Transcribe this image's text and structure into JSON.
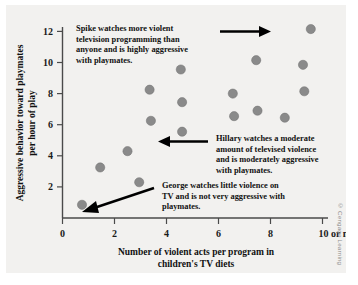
{
  "chart_data": {
    "type": "scatter",
    "title": "",
    "xlabel": "Number of violent acts per program in children's TV diets",
    "xlabel_line1": "Number of violent acts per program in",
    "xlabel_line2": "children's TV diets",
    "ylabel": "Aggressive behavior toward playmates per hour of play",
    "ylabel_line1": "Aggressive behavior toward playmates",
    "ylabel_line2": "per hour of play",
    "xlim": [
      0,
      10.6
    ],
    "ylim": [
      0,
      12.6
    ],
    "xticks": [
      0,
      2,
      4,
      6,
      8,
      10
    ],
    "xtick_labels": [
      "0",
      "2",
      "4",
      "6",
      "8",
      "10 or more"
    ],
    "yticks": [
      2,
      4,
      6,
      8,
      10,
      12
    ],
    "ytick_labels": [
      "2",
      "4",
      "6",
      "8",
      "10",
      "12"
    ],
    "grid": false,
    "legend": "none",
    "point_color": "#8a8a8a",
    "points": [
      {
        "x": 0.75,
        "y": 0.85,
        "name": "George"
      },
      {
        "x": 1.45,
        "y": 3.25
      },
      {
        "x": 2.5,
        "y": 4.3
      },
      {
        "x": 2.95,
        "y": 2.3
      },
      {
        "x": 3.35,
        "y": 8.25
      },
      {
        "x": 3.4,
        "y": 6.25
      },
      {
        "x": 4.55,
        "y": 9.55
      },
      {
        "x": 4.6,
        "y": 7.45
      },
      {
        "x": 4.6,
        "y": 5.55,
        "name": "Hillary"
      },
      {
        "x": 6.55,
        "y": 8.0
      },
      {
        "x": 6.6,
        "y": 6.55
      },
      {
        "x": 7.45,
        "y": 10.15
      },
      {
        "x": 7.5,
        "y": 6.9
      },
      {
        "x": 8.55,
        "y": 6.45
      },
      {
        "x": 9.25,
        "y": 9.85
      },
      {
        "x": 9.3,
        "y": 8.15
      },
      {
        "x": 9.55,
        "y": 12.15,
        "name": "Spike"
      }
    ],
    "annotations": [
      {
        "id": "spike",
        "lines": [
          "Spike watches more violent",
          "television programming than",
          "anyone and is highly aggressive",
          "with playmates."
        ],
        "points_to": {
          "x": 9.55,
          "y": 12.15
        },
        "arrow_direction": "right"
      },
      {
        "id": "hillary",
        "lines": [
          "Hillary watches a moderate",
          "amount of televised violence",
          "and is moderately aggressive",
          "with playmates."
        ],
        "points_to": {
          "x": 4.6,
          "y": 5.55
        },
        "arrow_direction": "left"
      },
      {
        "id": "george",
        "lines": [
          "George watches little violence on",
          "TV and is not very aggressive with",
          "playmates."
        ],
        "points_to": {
          "x": 0.75,
          "y": 0.85
        },
        "arrow_direction": "down-left"
      }
    ]
  },
  "credit": "© Cengage Learning"
}
